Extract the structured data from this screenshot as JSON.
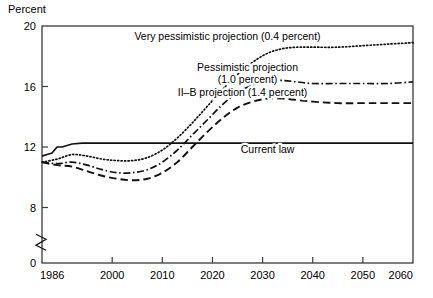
{
  "chart_data": {
    "type": "line",
    "title": "",
    "xlabel": "",
    "ylabel": "Percent",
    "ylabel_text": "Percent",
    "xlim": [
      1986,
      2060
    ],
    "ylim": [
      0,
      20
    ],
    "y_axis_break": true,
    "y_break_between": [
      0,
      8
    ],
    "grid": false,
    "legend_position": "inline-annotations",
    "xticks": [
      "1986",
      "2000",
      "2010",
      "2020",
      "2030",
      "2040",
      "2050",
      "2060"
    ],
    "xtick_values": [
      1986,
      2000,
      2010,
      2020,
      2030,
      2040,
      2050,
      2060
    ],
    "yticks": [
      "0",
      "8",
      "12",
      "16",
      "20"
    ],
    "ytick_values": [
      0,
      8,
      12,
      16,
      20
    ],
    "series": [
      {
        "name": "Very pessimistic projection (0.4 percent)",
        "style": "dotted",
        "x": [
          1986,
          1989,
          1992,
          1995,
          1998,
          2001,
          2004,
          2007,
          2010,
          2013,
          2016,
          2019,
          2022,
          2025,
          2028,
          2031,
          2034,
          2037,
          2040,
          2045,
          2050,
          2055,
          2060
        ],
        "values": [
          11.0,
          11.2,
          11.5,
          11.4,
          11.2,
          11.1,
          11.1,
          11.3,
          11.8,
          12.6,
          13.6,
          14.7,
          15.8,
          16.8,
          17.6,
          18.2,
          18.5,
          18.6,
          18.6,
          18.6,
          18.7,
          18.8,
          18.9
        ]
      },
      {
        "name": "Pessimistic projection (1.0 percent)",
        "style": "dash-dot",
        "x": [
          1986,
          1989,
          1992,
          1995,
          1998,
          2001,
          2004,
          2007,
          2010,
          2013,
          2016,
          2019,
          2022,
          2025,
          2028,
          2031,
          2034,
          2037,
          2040,
          2045,
          2050,
          2055,
          2060
        ],
        "values": [
          11.0,
          10.9,
          11.0,
          10.8,
          10.5,
          10.3,
          10.3,
          10.5,
          11.0,
          11.8,
          12.8,
          13.8,
          14.8,
          15.6,
          16.1,
          16.4,
          16.4,
          16.3,
          16.2,
          16.2,
          16.2,
          16.2,
          16.3
        ]
      },
      {
        "name": "II–B projection (1.4 percent)",
        "style": "dashed",
        "x": [
          1986,
          1989,
          1992,
          1995,
          1998,
          2001,
          2004,
          2007,
          2010,
          2013,
          2016,
          2019,
          2022,
          2025,
          2028,
          2031,
          2034,
          2037,
          2040,
          2045,
          2050,
          2055,
          2060
        ],
        "values": [
          11.0,
          10.8,
          10.7,
          10.4,
          10.1,
          9.9,
          9.8,
          9.9,
          10.3,
          11.0,
          12.0,
          13.0,
          13.9,
          14.6,
          15.0,
          15.2,
          15.2,
          15.1,
          15.0,
          14.9,
          14.9,
          14.9,
          14.9
        ]
      },
      {
        "name": "Current law",
        "style": "solid",
        "x": [
          1986,
          1987,
          1988,
          1989,
          1990,
          1992,
          1994,
          2000,
          2020,
          2040,
          2060
        ],
        "values": [
          11.4,
          11.5,
          11.6,
          12.0,
          12.0,
          12.2,
          12.25,
          12.25,
          12.25,
          12.25,
          12.25
        ]
      }
    ],
    "annotations": [
      {
        "text": "Very pessimistic projection (0.4 percent)",
        "x": 2023,
        "y": 19.1
      },
      {
        "text": "Pessimistic projection",
        "x": 2027,
        "y": 17.0
      },
      {
        "text": "(1.0 percent)",
        "x": 2027,
        "y": 16.2
      },
      {
        "text": "II–B projection (1.4 percent)",
        "x": 2026,
        "y": 15.4
      },
      {
        "text": "Current law",
        "x": 2031,
        "y": 11.6
      }
    ]
  }
}
